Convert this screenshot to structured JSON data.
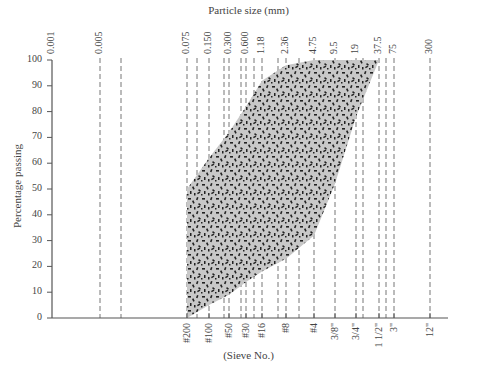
{
  "chart_data": {
    "type": "area",
    "title": "",
    "top_axis_title": "Particle size (mm)",
    "bottom_axis_title": "(Sieve No.)",
    "ylabel": "Percentage passing",
    "ylim": [
      0,
      100
    ],
    "yticks": [
      "0",
      "10",
      "20",
      "30",
      "40",
      "50",
      "60",
      "70",
      "80",
      "90",
      "100"
    ],
    "x_scale": "log",
    "grid": "vertical dashed lines at sieve sizes",
    "legend": "none",
    "top_tick_labels": [
      {
        "label": "0.001",
        "mm": 0.001
      },
      {
        "label": "0.005",
        "mm": 0.005
      },
      {
        "label": "0.075",
        "mm": 0.075
      },
      {
        "label": "0.150",
        "mm": 0.15
      },
      {
        "label": "0.300",
        "mm": 0.3
      },
      {
        "label": "0.600",
        "mm": 0.6
      },
      {
        "label": "1.18",
        "mm": 1.18
      },
      {
        "label": "2.36",
        "mm": 2.36
      },
      {
        "label": "4.75",
        "mm": 4.75
      },
      {
        "label": "9.5",
        "mm": 9.5
      },
      {
        "label": "19",
        "mm": 19
      },
      {
        "label": "37.5",
        "mm": 37.5
      },
      {
        "label": "75",
        "mm": 75
      },
      {
        "label": "300",
        "mm": 300
      }
    ],
    "bottom_tick_labels": [
      {
        "label": "#200",
        "mm": 0.075
      },
      {
        "label": "#100",
        "mm": 0.15
      },
      {
        "label": "#50",
        "mm": 0.3
      },
      {
        "label": "#30",
        "mm": 0.6
      },
      {
        "label": "#16",
        "mm": 1.18
      },
      {
        "label": "#8",
        "mm": 2.36
      },
      {
        "label": "#4",
        "mm": 4.75
      },
      {
        "label": "3/8\"",
        "mm": 9.5
      },
      {
        "label": "3/4\"",
        "mm": 19
      },
      {
        "label": "1 1/2\"",
        "mm": 37.5
      },
      {
        "label": "3\"",
        "mm": 75
      },
      {
        "label": "12\"",
        "mm": 300
      }
    ],
    "series": [
      {
        "name": "Upper gradation limit (fine boundary)",
        "x_mm": [
          0.075,
          0.15,
          0.3,
          0.6,
          1.18,
          2.36,
          4.75
        ],
        "values": [
          50,
          62,
          72,
          82,
          92,
          98,
          100
        ]
      },
      {
        "name": "Lower gradation limit (coarse boundary)",
        "x_mm": [
          0.075,
          0.15,
          0.3,
          0.6,
          1.18,
          2.36,
          4.75,
          9.5,
          19,
          37.5
        ],
        "values": [
          0,
          5,
          9,
          14,
          18,
          23,
          32,
          52,
          78,
          100
        ]
      }
    ],
    "shaded_region": "Speckled gray band between upper and lower limits"
  }
}
